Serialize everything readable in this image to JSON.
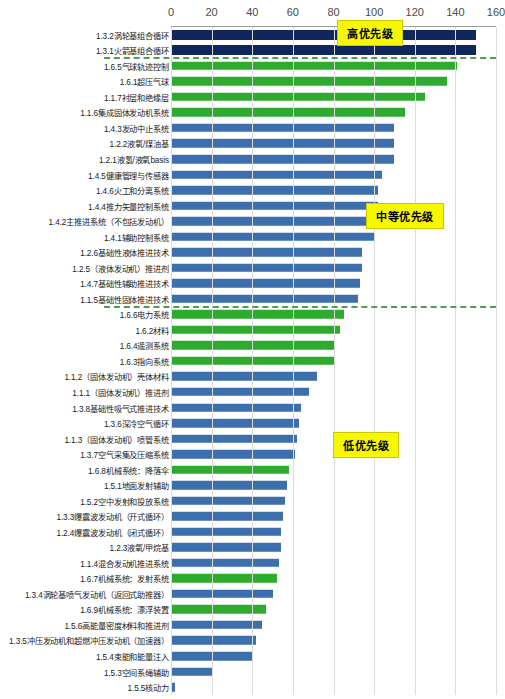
{
  "chart_data": {
    "type": "bar",
    "orientation": "horizontal",
    "title": "",
    "xlabel": "",
    "ylabel": "",
    "xlim": [
      0,
      160
    ],
    "xticks": [
      0,
      20,
      40,
      60,
      80,
      100,
      120,
      140,
      160
    ],
    "grid": true,
    "legend": "none",
    "colors": {
      "navy": "#10265c",
      "green": "#2eaa2e",
      "blue": "#3d6fad",
      "callout_fill": "#f7f700",
      "separator": "#4f9d4f"
    },
    "annotations": [
      {
        "text": "高优先级",
        "group": "high"
      },
      {
        "text": "中等优先级",
        "group": "medium"
      },
      {
        "text": "低优先级",
        "group": "low"
      }
    ],
    "categories": [
      "1.3.2涡轮基组合循环",
      "1.3.1火箭基组合循环",
      "1.6.5气球轨迹控制",
      "1.6.1超压气球",
      "1.1.7衬层和绝缘层",
      "1.1.6集成固体发动机系统",
      "1.4.3发动中止系统",
      "1.2.2液氧/煤油基",
      "1.2.1液氢/液氧basis",
      "1.4.5健康管理与传感器",
      "1.4.6火工和分离系统",
      "1.4.4推力矢量控制系统",
      "1.4.2主推进系统（不包括发动机）",
      "1.4.1辅助控制系统",
      "1.2.6基础性液体推进技术",
      "1.2.5（液体发动机）推进剂",
      "1.4.7基础性辅助推进技术",
      "1.1.5基础性固体推进技术",
      "1.6.6电力系统",
      "1.6.2材料",
      "1.6.4遥测系统",
      "1.6.3指向系统",
      "1.1.2（固体发动机）壳体材料",
      "1.1.1（固体发动机）推进剂",
      "1.3.8基础性吸气式推进技术",
      "1.3.6深冷空气循环",
      "1.1.3（固体发动机）喷管系统",
      "1.3.7空气采集及压缩系统",
      "1.6.8机械系统：降落伞",
      "1.5.1地面发射辅助",
      "1.5.2空中发射和投放系统",
      "1.3.3爆震波发动机（开式循环）",
      "1.2.4爆震波发动机（闭式循环）",
      "1.2.3液氧/甲烷基",
      "1.1.4混合发动机推进系统",
      "1.6.7机械系统：发射系统",
      "1.3.4涡轮基喷气发动机（返回式助推器）",
      "1.6.9机械系统：漂浮装置",
      "1.5.6高能量密度材料和推进剂",
      "1.3.5冲压发动机和超燃冲压发动机（加速器）",
      "1.5.4束能和能量注入",
      "1.5.3空间系绳辅助",
      "1.5.5核动力"
    ],
    "values": [
      150,
      150,
      141,
      136,
      125,
      115,
      110,
      110,
      110,
      104,
      102,
      102,
      102,
      100,
      94,
      94,
      93,
      92,
      85,
      83,
      80,
      80,
      72,
      68,
      64,
      63,
      62,
      61,
      58,
      57,
      56,
      55,
      54,
      54,
      53,
      52,
      50,
      47,
      45,
      42,
      40,
      20,
      2
    ],
    "bar_colors": [
      "navy",
      "navy",
      "green",
      "green",
      "green",
      "green",
      "blue",
      "blue",
      "blue",
      "blue",
      "blue",
      "blue",
      "blue",
      "blue",
      "blue",
      "blue",
      "blue",
      "blue",
      "green",
      "green",
      "green",
      "green",
      "blue",
      "blue",
      "blue",
      "blue",
      "blue",
      "blue",
      "green",
      "blue",
      "blue",
      "blue",
      "blue",
      "blue",
      "blue",
      "green",
      "blue",
      "green",
      "blue",
      "blue",
      "blue",
      "blue",
      "blue"
    ],
    "groups": [
      {
        "name": "高优先级",
        "start_index": 0,
        "end_index": 1
      },
      {
        "name": "中等优先级",
        "start_index": 2,
        "end_index": 17
      },
      {
        "name": "低优先级",
        "start_index": 18,
        "end_index": 42
      }
    ]
  }
}
